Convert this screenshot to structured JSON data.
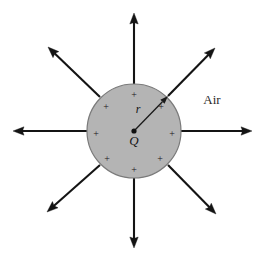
{
  "figure": {
    "name": "point-charge-electric-field-diagram",
    "width": 262,
    "height": 258,
    "background_color": "#ffffff"
  },
  "sphere": {
    "name": "charged-sphere",
    "center_x": 134,
    "center_y": 131,
    "radius": 47,
    "fill_color": "#b4b4b4",
    "stroke_color": "#7a7a7a",
    "stroke_width": 1.2
  },
  "labels": {
    "medium": {
      "text": "Air",
      "x": 212,
      "y": 104,
      "font_size": 13,
      "italic": false,
      "color": "#2b2b2b"
    },
    "charge": {
      "text": "Q",
      "x": 134,
      "y": 145,
      "font_size": 13,
      "italic": true,
      "color": "#141414"
    },
    "radius": {
      "text": "r",
      "x": 138,
      "y": 113,
      "font_size": 12,
      "italic": true,
      "color": "#141414"
    }
  },
  "center_dot": {
    "name": "charge-center-dot",
    "x": 134,
    "y": 131,
    "radius": 2.6,
    "color": "#111111"
  },
  "radius_arrow": {
    "name": "radius-vector",
    "from_x": 134,
    "from_y": 131,
    "to_x": 168,
    "to_y": 96,
    "color": "#1a1a1a",
    "stroke_width": 1.3
  },
  "field_lines": [
    {
      "name": "field-line-up",
      "angle_deg": 270,
      "tip_x": 134,
      "tip_y": 13,
      "start_x": 134,
      "start_y": 84
    },
    {
      "name": "field-line-up-right",
      "angle_deg": 315,
      "tip_x": 215,
      "tip_y": 48,
      "start_x": 168,
      "start_y": 96
    },
    {
      "name": "field-line-right",
      "angle_deg": 0,
      "tip_x": 252,
      "tip_y": 131,
      "start_x": 181,
      "start_y": 131
    },
    {
      "name": "field-line-down-right",
      "angle_deg": 45,
      "tip_x": 216,
      "tip_y": 214,
      "start_x": 168,
      "start_y": 165
    },
    {
      "name": "field-line-down",
      "angle_deg": 90,
      "tip_x": 134,
      "tip_y": 248,
      "start_x": 134,
      "start_y": 178
    },
    {
      "name": "field-line-down-left",
      "angle_deg": 135,
      "tip_x": 47,
      "tip_y": 212,
      "start_x": 100,
      "start_y": 165
    },
    {
      "name": "field-line-left",
      "angle_deg": 180,
      "tip_x": 13,
      "tip_y": 131,
      "start_x": 87,
      "start_y": 131
    },
    {
      "name": "field-line-up-left",
      "angle_deg": 225,
      "tip_x": 48,
      "tip_y": 47,
      "start_x": 100,
      "start_y": 97
    }
  ],
  "field_line_style": {
    "color": "#141414",
    "stroke_width": 2.1,
    "arrow_length": 11,
    "arrow_half_width": 4.2
  },
  "charge_symbols": {
    "glyph": "+",
    "color": "#1a1a1a",
    "font_size": 10,
    "positions": [
      {
        "x": 134,
        "y": 94
      },
      {
        "x": 106,
        "y": 106
      },
      {
        "x": 161,
        "y": 106
      },
      {
        "x": 96,
        "y": 133
      },
      {
        "x": 172,
        "y": 133
      },
      {
        "x": 107,
        "y": 158
      },
      {
        "x": 160,
        "y": 158
      },
      {
        "x": 134,
        "y": 169
      }
    ]
  }
}
